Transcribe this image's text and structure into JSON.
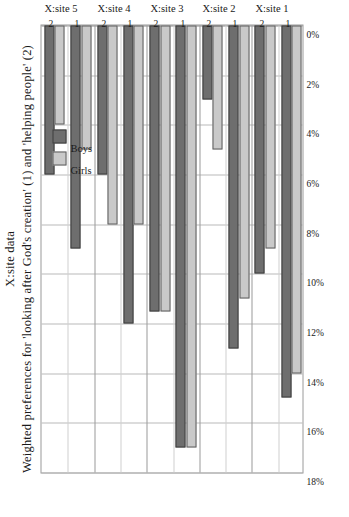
{
  "figure": {
    "title": "X:site data",
    "subtitle": "Weighted preferences for 'looking after God's creation' (1) and 'helping people' (2)"
  },
  "legend": {
    "position": "upper-left-inside",
    "entries": [
      {
        "label": "Girls",
        "color": "#c9c9c9"
      },
      {
        "label": "Boys",
        "color": "#6e6e6e"
      }
    ]
  },
  "axis": {
    "tick_labels": [
      "18%",
      "16%",
      "14%",
      "12%",
      "10%",
      "8%",
      "6%",
      "4%",
      "2%",
      "0%"
    ],
    "max": 18,
    "min": 0
  },
  "sites": [
    {
      "label": "X:site 1",
      "groups": [
        {
          "pref": "1"
        },
        {
          "pref": "2"
        }
      ]
    },
    {
      "label": "X:site 2",
      "groups": [
        {
          "pref": "1"
        },
        {
          "pref": "2"
        }
      ]
    },
    {
      "label": "X:site 3",
      "groups": [
        {
          "pref": "1"
        },
        {
          "pref": "2"
        }
      ]
    },
    {
      "label": "X:site 4",
      "groups": [
        {
          "pref": "1"
        },
        {
          "pref": "2"
        }
      ]
    },
    {
      "label": "X:site 5",
      "groups": [
        {
          "pref": "1"
        },
        {
          "pref": "2"
        }
      ]
    }
  ],
  "chart_data": {
    "type": "bar",
    "orientation": "horizontal",
    "title": "X:site data",
    "subtitle": "Weighted preferences for 'looking after God's creation' (1) and 'helping people' (2)",
    "xlabel": "",
    "ylabel": "",
    "xlim": [
      0,
      18
    ],
    "xtick_labels": [
      "0%",
      "2%",
      "4%",
      "6%",
      "8%",
      "10%",
      "12%",
      "14%",
      "16%",
      "18%"
    ],
    "xticks": [
      0,
      2,
      4,
      6,
      8,
      10,
      12,
      14,
      16,
      18
    ],
    "grid": true,
    "grid_axis": "x",
    "units": "percent",
    "legend": [
      "Girls",
      "Boys"
    ],
    "categories": [
      "X:site 1 - 1",
      "X:site 1 - 2",
      "X:site 2 - 1",
      "X:site 2 - 2",
      "X:site 3 - 1",
      "X:site 3 - 2",
      "X:site 4 - 1",
      "X:site 4 - 2",
      "X:site 5 - 1",
      "X:site 5 - 2"
    ],
    "series": [
      {
        "name": "Girls",
        "color": "#c9c9c9",
        "values": [
          14.0,
          9.0,
          11.0,
          5.0,
          17.0,
          11.5,
          8.0,
          8.0,
          5.0,
          4.0
        ]
      },
      {
        "name": "Boys",
        "color": "#6e6e6e",
        "values": [
          15.0,
          10.0,
          13.0,
          3.0,
          17.0,
          11.5,
          12.0,
          6.0,
          9.0,
          6.0
        ]
      }
    ]
  }
}
